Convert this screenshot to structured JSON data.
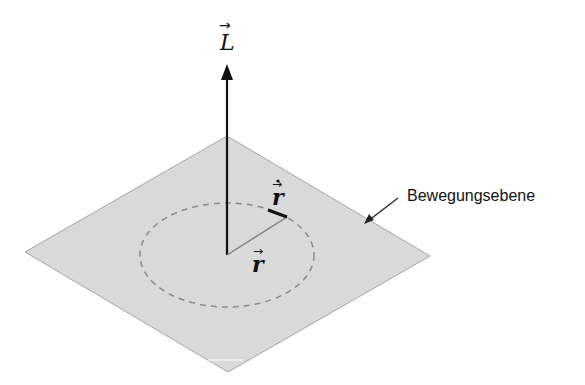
{
  "diagram": {
    "vectors": {
      "angular_momentum": {
        "symbol": "L",
        "arrow": "→"
      },
      "position": {
        "symbol": "r",
        "arrow": "→"
      },
      "velocity": {
        "symbol": "ṙ",
        "arrow": "→",
        "dot": true
      }
    },
    "plane_label": "Bewegungsebene",
    "colors": {
      "plane_fill": "#d9d9d9",
      "plane_edge": "#a6a6a6",
      "orbit_dash": "#8c8c8c",
      "vector": "#111111",
      "position_line": "#7f7f7f"
    }
  }
}
